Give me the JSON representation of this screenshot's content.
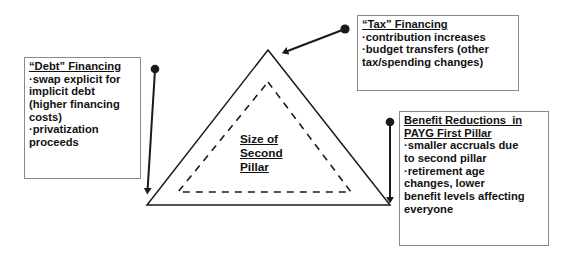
{
  "diagram": {
    "background_color": "#ffffff",
    "line_color": "#1a1a1a",
    "box_border_color": "#8a8a8a",
    "text_color": "#111111",
    "center_label": {
      "lines": [
        "Size of",
        "Second",
        "Pillar"
      ],
      "underlined": true
    },
    "shapes": {
      "outer_triangle": {
        "style": "solid",
        "apex": [
          268,
          50
        ],
        "bottom_left": [
          147,
          205
        ],
        "bottom_right": [
          390,
          205
        ]
      },
      "inner_triangle": {
        "style": "dashed",
        "apex": [
          268,
          82
        ],
        "bottom_left": [
          178,
          192
        ],
        "bottom_right": [
          351,
          192
        ]
      }
    },
    "connectors": [
      {
        "name": "debt-connector",
        "dot": [
          155,
          69
        ],
        "arrow_tip": [
          147,
          197
        ],
        "direction": "down"
      },
      {
        "name": "tax-connector",
        "dot": [
          345,
          29
        ],
        "arrow_tip": [
          280,
          55
        ],
        "direction": "down-left"
      },
      {
        "name": "benefit-connector",
        "dot": [
          390,
          122
        ],
        "arrow_tip": [
          390,
          207
        ],
        "direction": "down"
      }
    ]
  },
  "callouts": {
    "debt": {
      "heading": "“Debt” Financing",
      "lines": [
        "·swap explicit for",
        "implicit debt",
        "(higher financing",
        "costs)",
        "·privatization",
        "proceeds"
      ]
    },
    "tax": {
      "heading": "“Tax” Financing",
      "lines": [
        "·contribution increases",
        "·budget transfers (other",
        "tax/spending changes)"
      ]
    },
    "benefit": {
      "heading_line1": "Benefit Reductions  in",
      "heading_line2": "PAYG First Pillar",
      "lines": [
        "·smaller accruals due",
        "to second pillar",
        "·retirement age",
        "changes, lower",
        "benefit levels affecting",
        "everyone"
      ]
    }
  }
}
